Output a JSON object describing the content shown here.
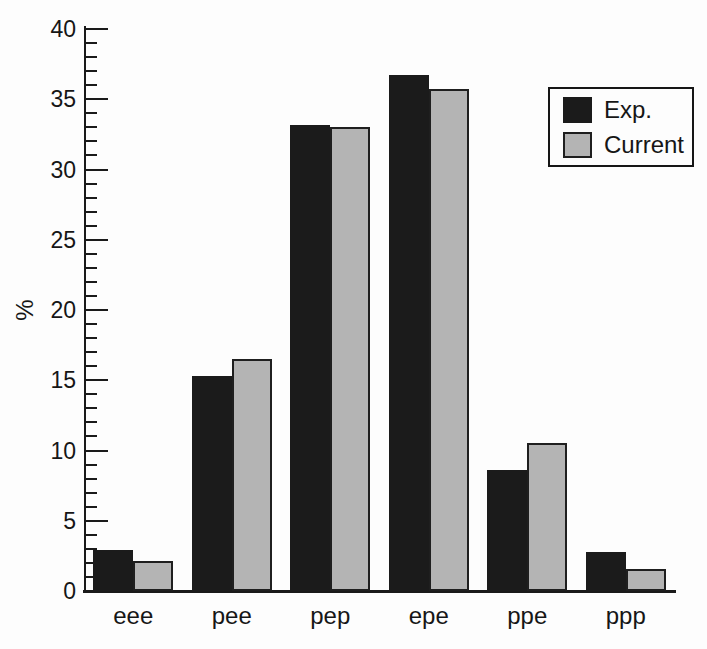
{
  "chart_data": {
    "type": "bar",
    "title": "",
    "xlabel": "",
    "ylabel": "%",
    "categories": [
      "eee",
      "pee",
      "pep",
      "epe",
      "ppe",
      "ppp"
    ],
    "series": [
      {
        "name": "Exp.",
        "color": "#1b1b1b",
        "border": "#1b1b1b",
        "values": [
          2.9,
          15.3,
          33.2,
          36.7,
          8.6,
          2.8
        ]
      },
      {
        "name": "Current",
        "color": "#b4b4b4",
        "border": "#1f1f1f",
        "values": [
          2.1,
          16.5,
          33.0,
          35.7,
          10.5,
          1.6
        ]
      }
    ],
    "ylim": [
      0,
      40
    ],
    "y_major_tick_step": 5,
    "y_minor_tick_step": 1,
    "y_major_tick_labels": [
      "0",
      "5",
      "10",
      "15",
      "20",
      "25",
      "30",
      "35",
      "40"
    ],
    "grid": false,
    "legend_position": "top-right"
  }
}
